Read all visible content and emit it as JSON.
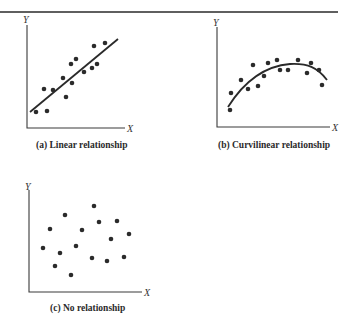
{
  "chart_data": [
    {
      "type": "scatter",
      "panel": "a",
      "title": "(a) Linear relationship",
      "xlabel": "X",
      "ylabel": "Y",
      "grid": false,
      "frame": {
        "x0": 27,
        "y0": 128,
        "x1": 125,
        "ytop": 25
      },
      "points": [
        [
          36,
          112
        ],
        [
          47,
          111
        ],
        [
          44,
          89
        ],
        [
          53,
          90
        ],
        [
          63,
          78
        ],
        [
          66,
          97
        ],
        [
          71,
          64
        ],
        [
          76,
          59
        ],
        [
          72,
          83
        ],
        [
          84,
          72
        ],
        [
          92,
          68
        ],
        [
          97,
          64
        ],
        [
          94,
          46
        ],
        [
          105,
          43
        ]
      ],
      "fit": {
        "kind": "line",
        "path": "M30,112 L118,39"
      }
    },
    {
      "type": "scatter",
      "panel": "b",
      "title": "(b) Curvilinear relationship",
      "xlabel": "X",
      "ylabel": "Y",
      "grid": false,
      "frame": {
        "x0": 217,
        "y0": 127,
        "x1": 330,
        "ytop": 27
      },
      "points": [
        [
          230,
          110
        ],
        [
          231,
          93
        ],
        [
          241,
          80
        ],
        [
          248,
          89
        ],
        [
          253,
          65
        ],
        [
          258,
          86
        ],
        [
          264,
          76
        ],
        [
          268,
          63
        ],
        [
          277,
          60
        ],
        [
          280,
          70
        ],
        [
          288,
          70
        ],
        [
          298,
          60
        ],
        [
          307,
          73
        ],
        [
          311,
          63
        ],
        [
          319,
          70
        ],
        [
          322,
          85
        ]
      ],
      "fit": {
        "kind": "curve",
        "path": "M228,107 C245,80 265,66 290,64 C308,63 318,68 327,80"
      }
    },
    {
      "type": "scatter",
      "panel": "c",
      "title": "(c) No relationship",
      "xlabel": "X",
      "ylabel": "Y",
      "grid": false,
      "frame": {
        "x0": 29,
        "y0": 292,
        "x1": 142,
        "ytop": 190
      },
      "points": [
        [
          43,
          248
        ],
        [
          50,
          229
        ],
        [
          55,
          266
        ],
        [
          60,
          253
        ],
        [
          65,
          215
        ],
        [
          71,
          275
        ],
        [
          76,
          246
        ],
        [
          82,
          230
        ],
        [
          92,
          258
        ],
        [
          94,
          206
        ],
        [
          99,
          222
        ],
        [
          107,
          261
        ],
        [
          111,
          239
        ],
        [
          117,
          221
        ],
        [
          124,
          257
        ],
        [
          129,
          234
        ]
      ],
      "fit": null
    }
  ],
  "captions": {
    "a": "(a)  Linear relationship",
    "b": "(b)  Curvilinear relationship",
    "c": "(c)  No relationship"
  },
  "axes": {
    "x": "X",
    "y": "Y"
  }
}
